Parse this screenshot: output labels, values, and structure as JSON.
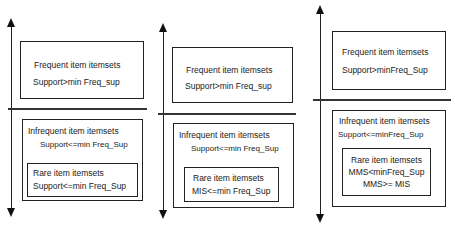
{
  "panels": [
    {
      "frequent": {
        "title": "Frequent item itemsets",
        "condition": "Support>min Freq_sup"
      },
      "infrequent": {
        "title": "Infrequent  item itemsets",
        "condition": "Support<=min Freq_Sup"
      },
      "rare": {
        "title": "Rare item itemsets",
        "conditions": [
          "Support<=min Freq_Sup"
        ]
      }
    },
    {
      "frequent": {
        "title": "Frequent item itemsets",
        "condition": "Support>min Freq_sup"
      },
      "infrequent": {
        "title": "Infrequent  item itemsets",
        "condition": "Support<=min Freq_Sup"
      },
      "rare": {
        "title": "Rare item itemsets",
        "conditions": [
          "MIS<=min Freq_Sup"
        ]
      }
    },
    {
      "frequent": {
        "title": "Frequent item itemsets",
        "condition": "Support>minFreq_Sup"
      },
      "infrequent": {
        "title": "Infrequent  item itemsets",
        "condition": "Support<=minFreq_Sup"
      },
      "rare": {
        "title": "Rare item itemsets",
        "conditions": [
          "MMS<minFreq_Sup",
          "MMS>= MIS"
        ]
      }
    }
  ],
  "colors": {
    "line": "#222222",
    "background": "#ffffff",
    "text": "#222222"
  }
}
